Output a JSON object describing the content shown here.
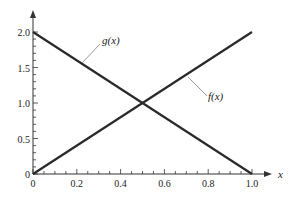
{
  "chart_data": {
    "type": "line",
    "title": "",
    "xlabel": "x",
    "ylabel": "",
    "xlim": [
      0,
      1.0
    ],
    "ylim": [
      0,
      2.0
    ],
    "x_ticks": [
      "0",
      "0.2",
      "0.4",
      "0.6",
      "0.8",
      "1.0"
    ],
    "y_ticks": [
      "0",
      "0.5",
      "1.0",
      "1.5",
      "2.0"
    ],
    "grid": false,
    "series": [
      {
        "name": "f(x)",
        "x": [
          0,
          1.0
        ],
        "values": [
          0,
          2.0
        ],
        "label": "f(x)"
      },
      {
        "name": "g(x)",
        "x": [
          0,
          1.0
        ],
        "values": [
          2.0,
          0
        ],
        "label": "g(x)"
      }
    ],
    "annotations": [
      {
        "text": "g(x)",
        "points_to": "g(x) line near x≈0.25"
      },
      {
        "text": "f(x)",
        "points_to": "f(x) line near x≈0.7"
      }
    ],
    "intersection": {
      "x": 0.5,
      "y": 1.0
    }
  },
  "colors": {
    "line": "#2a2a2a",
    "axis": "#333333",
    "background": "#ffffff"
  }
}
